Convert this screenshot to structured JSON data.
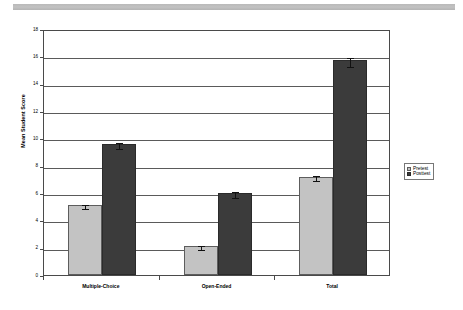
{
  "chart_data": {
    "type": "bar",
    "title": "",
    "subtitle": "",
    "xlabel": "",
    "ylabel": "Mean Student Score",
    "categories": [
      "Multiple-Choice",
      "Open-Ended",
      "Total"
    ],
    "series": [
      {
        "name": "Pretest",
        "color": "#c3c3c3",
        "values": [
          5.1,
          2.1,
          7.2
        ],
        "errors": [
          0.15,
          0.15,
          0.2
        ]
      },
      {
        "name": "Posttest",
        "color": "#3b3b3b",
        "values": [
          9.6,
          6.0,
          15.7
        ],
        "errors": [
          0.2,
          0.2,
          0.35
        ]
      }
    ],
    "ylim": [
      0,
      18
    ],
    "yticks": [
      0,
      2,
      4,
      6,
      8,
      10,
      12,
      14,
      16,
      18
    ],
    "ytick_labels": [
      "0",
      "2",
      "4",
      "6",
      "8",
      "10",
      "12",
      "14",
      "16",
      "18"
    ],
    "grid": true,
    "grid_axis": "y",
    "legend": [
      "Pretest",
      "Posttest"
    ],
    "legend_position": "right",
    "error_bars": true
  },
  "axes": {
    "y_title": "Mean Student Score"
  },
  "legend": {
    "entries": [
      {
        "label": "Pretest",
        "swatch": "pretest-swatch"
      },
      {
        "label": "Posttest",
        "swatch": "posttest-swatch"
      }
    ]
  },
  "banner": {
    "color": "#bcbcbc"
  }
}
